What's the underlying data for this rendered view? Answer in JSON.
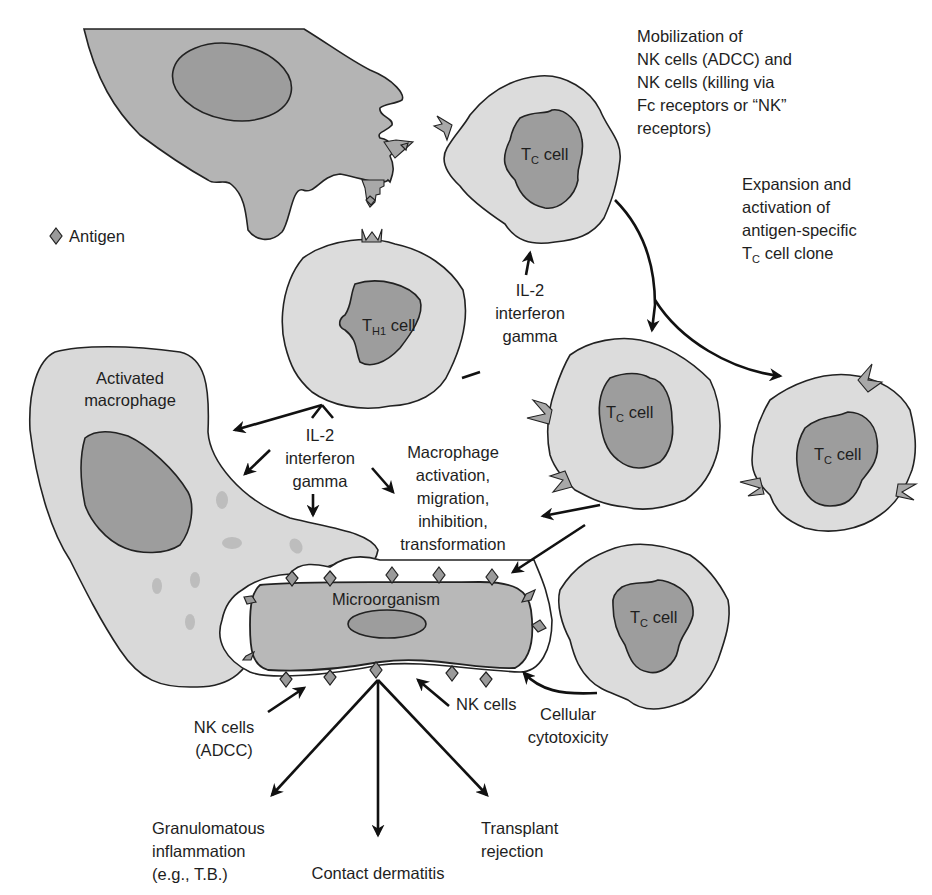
{
  "legend": {
    "antigen_label": "Antigen",
    "antigen_icon": "diamond-icon"
  },
  "cells": {
    "apc": {
      "line1": "Antigen-presenting",
      "line2": "cell"
    },
    "th1": {
      "main": "T",
      "sub": "H1",
      "rest": " cell"
    },
    "tc_top": {
      "main": "T",
      "sub": "C",
      "rest": " cell"
    },
    "tc_mid": {
      "main": "T",
      "sub": "C",
      "rest": " cell"
    },
    "tc_right": {
      "main": "T",
      "sub": "C",
      "rest": " cell"
    },
    "tc_bottom": {
      "main": "T",
      "sub": "C",
      "rest": " cell"
    },
    "macrophage": {
      "line1": "Activated",
      "line2": "macrophage"
    },
    "microorganism": {
      "label": "Microorganism"
    }
  },
  "annotations": {
    "mobilization": [
      "Mobilization of",
      "NK cells (ADCC) and",
      "NK cells (killing via",
      "Fc receptors or “NK”",
      "receptors)"
    ],
    "expansion": [
      "Expansion and",
      "activation of",
      "antigen-specific"
    ],
    "expansion_last": {
      "main": "T",
      "sub": "C",
      "rest": " cell clone"
    },
    "cytokines_upper": [
      "IL-2",
      "interferon",
      "gamma"
    ],
    "cytokines_lower": [
      "IL-2",
      "interferon",
      "gamma"
    ],
    "macrophage_effects": [
      "Macrophage",
      "activation,",
      "migration,",
      "inhibition,",
      "transformation"
    ],
    "nk_adcc": [
      "NK cells",
      "(ADCC)"
    ],
    "nk_cells": "NK cells",
    "cellular_cytotoxicity": [
      "Cellular",
      "cytotoxicity"
    ]
  },
  "outcomes": {
    "granulomatous": [
      "Granulomatous",
      "inflammation",
      "(e.g., T.B.)"
    ],
    "contact": "Contact dermatitis",
    "transplant": [
      "Transplant",
      "rejection"
    ]
  },
  "colors": {
    "cell_fill": "#dcdcdc",
    "apc_fill": "#b4b4b4",
    "nucleus_fill": "#9d9d9d",
    "antigen_fill": "#9a9a9a",
    "outline": "#222222"
  }
}
